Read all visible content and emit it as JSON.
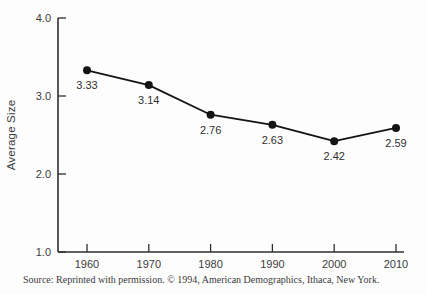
{
  "chart_data": {
    "type": "line",
    "title": "",
    "categories": [
      "1960",
      "1970",
      "1980",
      "1990",
      "2000",
      "2010"
    ],
    "values": [
      3.33,
      3.14,
      2.76,
      2.63,
      2.42,
      2.59
    ],
    "point_labels": [
      "3.33",
      "3.14",
      "2.76",
      "2.63",
      "2.42",
      "2.59"
    ],
    "xlabel": "",
    "ylabel": "Average Size",
    "ylim": [
      1.0,
      4.0
    ],
    "y_ticks": [
      4.0,
      3.0,
      2.0,
      1.0
    ],
    "y_tick_labels": [
      "4.0",
      "3.0",
      "2.0",
      "1.0"
    ],
    "grid": false,
    "legend": "none",
    "line_color": "#141414",
    "axis_color": "#2e2e2e",
    "marker": "filled-circle"
  },
  "source_note": "Source: Reprinted with permission. © 1994, American Demographics, Ithaca, New York."
}
